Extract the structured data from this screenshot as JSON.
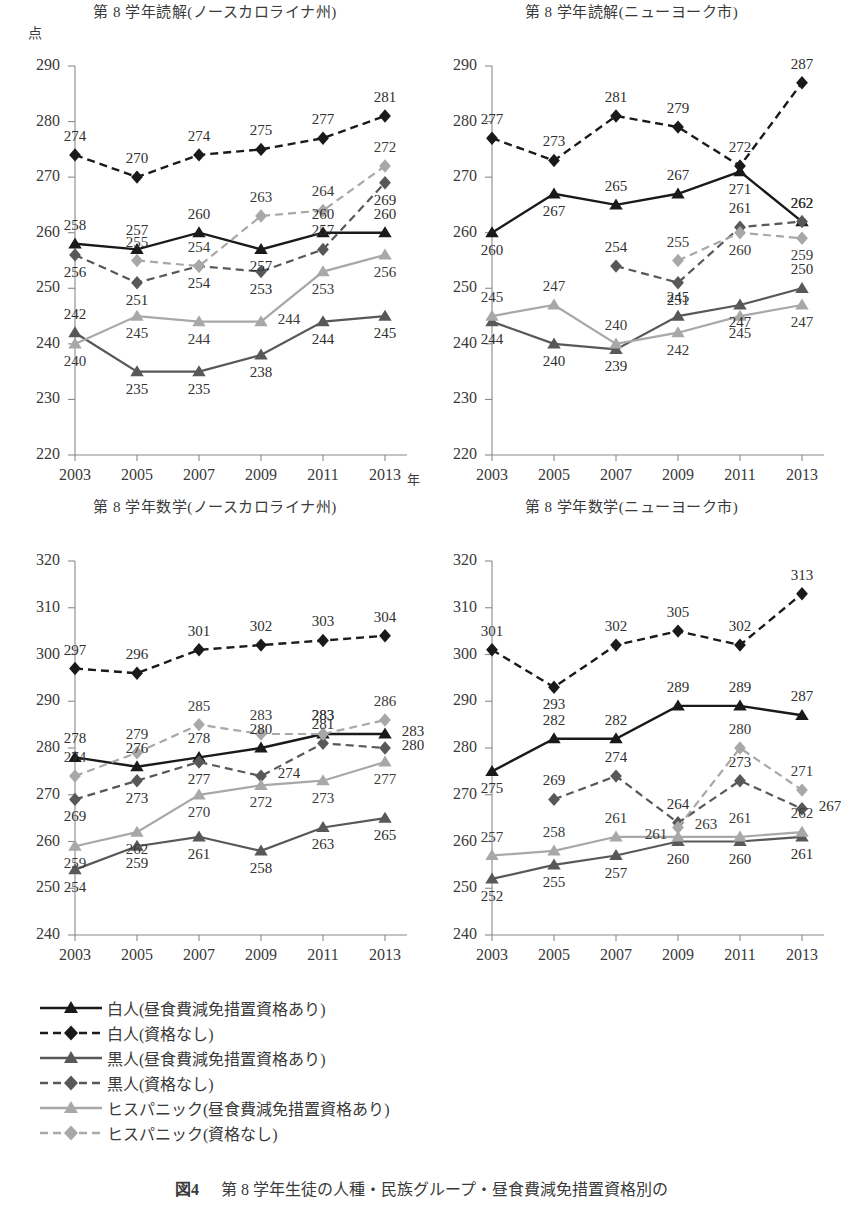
{
  "figure": {
    "caption_label": "図4",
    "caption_text": "第 8 学年生徒の人種・民族グループ・昼食費減免措置資格別の",
    "y_unit": "点",
    "x_unit": "年"
  },
  "legend": {
    "items": [
      {
        "label": "白人(昼食費減免措置資格あり)",
        "color": "#1a1a1a",
        "dash": "solid",
        "marker": "triangle"
      },
      {
        "label": "白人(資格なし)",
        "color": "#1a1a1a",
        "dash": "dashed",
        "marker": "diamond"
      },
      {
        "label": "黒人(昼食費減免措置資格あり)",
        "color": "#585858",
        "dash": "solid",
        "marker": "triangle"
      },
      {
        "label": "黒人(資格なし)",
        "color": "#585858",
        "dash": "dashed",
        "marker": "diamond"
      },
      {
        "label": "ヒスパニック(昼食費減免措置資格あり)",
        "color": "#a8a8a8",
        "dash": "solid",
        "marker": "triangle"
      },
      {
        "label": "ヒスパニック(資格なし)",
        "color": "#a8a8a8",
        "dash": "dashed",
        "marker": "diamond"
      }
    ]
  },
  "chart_data": [
    {
      "type": "line",
      "title": "第 8 学年読解(ノースカロライナ州)",
      "x": [
        "2003",
        "2005",
        "2007",
        "2009",
        "2011",
        "2013"
      ],
      "xlabel": "年",
      "ylabel": "点",
      "ylim": [
        220,
        290
      ],
      "yticks": [
        220,
        230,
        240,
        250,
        260,
        270,
        280,
        290
      ],
      "grid": false,
      "series": [
        {
          "name": "白人(昼食費減免措置資格あり)",
          "color": "#1a1a1a",
          "dash": "solid",
          "marker": "triangle",
          "values": [
            258,
            257,
            260,
            257,
            260,
            260
          ]
        },
        {
          "name": "白人(資格なし)",
          "color": "#1a1a1a",
          "dash": "dashed",
          "marker": "diamond",
          "values": [
            274,
            270,
            274,
            275,
            277,
            281
          ]
        },
        {
          "name": "黒人(昼食費減免措置資格あり)",
          "color": "#585858",
          "dash": "solid",
          "marker": "triangle",
          "values": [
            242,
            235,
            235,
            238,
            244,
            245
          ]
        },
        {
          "name": "黒人(資格なし)",
          "color": "#585858",
          "dash": "dashed",
          "marker": "diamond",
          "values": [
            256,
            251,
            254,
            253,
            257,
            269
          ]
        },
        {
          "name": "ヒスパニック(昼食費減免措置資格あり)",
          "color": "#a8a8a8",
          "dash": "solid",
          "marker": "triangle",
          "values": [
            240,
            245,
            244,
            244,
            253,
            256
          ]
        },
        {
          "name": "ヒスパニック(資格なし)",
          "color": "#a8a8a8",
          "dash": "dashed",
          "marker": "diamond",
          "values": [
            null,
            255,
            254,
            263,
            264,
            272
          ]
        }
      ]
    },
    {
      "type": "line",
      "title": "第 8 学年読解(ニューヨーク市)",
      "x": [
        "2003",
        "2005",
        "2007",
        "2009",
        "2011",
        "2013"
      ],
      "xlabel": "",
      "ylabel": "",
      "ylim": [
        220,
        290
      ],
      "yticks": [
        220,
        230,
        240,
        250,
        260,
        270,
        280,
        290
      ],
      "grid": false,
      "series": [
        {
          "name": "白人(昼食費減免措置資格あり)",
          "color": "#1a1a1a",
          "dash": "solid",
          "marker": "triangle",
          "values": [
            260,
            267,
            265,
            267,
            271,
            262
          ]
        },
        {
          "name": "白人(資格なし)",
          "color": "#1a1a1a",
          "dash": "dashed",
          "marker": "diamond",
          "values": [
            277,
            273,
            281,
            279,
            272,
            287
          ]
        },
        {
          "name": "黒人(昼食費減免措置資格あり)",
          "color": "#585858",
          "dash": "solid",
          "marker": "triangle",
          "values": [
            244,
            240,
            239,
            245,
            247,
            250
          ]
        },
        {
          "name": "黒人(資格なし)",
          "color": "#585858",
          "dash": "dashed",
          "marker": "diamond",
          "values": [
            null,
            null,
            254,
            251,
            261,
            262
          ]
        },
        {
          "name": "ヒスパニック(昼食費減免措置資格あり)",
          "color": "#a8a8a8",
          "dash": "solid",
          "marker": "triangle",
          "values": [
            245,
            247,
            240,
            242,
            245,
            247
          ]
        },
        {
          "name": "ヒスパニック(資格なし)",
          "color": "#a8a8a8",
          "dash": "dashed",
          "marker": "diamond",
          "values": [
            null,
            null,
            null,
            255,
            260,
            259
          ]
        }
      ]
    },
    {
      "type": "line",
      "title": "第 8 学年数学(ノースカロライナ州)",
      "x": [
        "2003",
        "2005",
        "2007",
        "2009",
        "2011",
        "2013"
      ],
      "xlabel": "",
      "ylabel": "",
      "ylim": [
        240,
        320
      ],
      "yticks": [
        240,
        250,
        260,
        270,
        280,
        290,
        300,
        310,
        320
      ],
      "grid": false,
      "series": [
        {
          "name": "白人(昼食費減免措置資格あり)",
          "color": "#1a1a1a",
          "dash": "solid",
          "marker": "triangle",
          "values": [
            278,
            276,
            278,
            280,
            283,
            283
          ]
        },
        {
          "name": "白人(資格なし)",
          "color": "#1a1a1a",
          "dash": "dashed",
          "marker": "diamond",
          "values": [
            297,
            296,
            301,
            302,
            303,
            304
          ]
        },
        {
          "name": "黒人(昼食費減免措置資格あり)",
          "color": "#585858",
          "dash": "solid",
          "marker": "triangle",
          "values": [
            254,
            259,
            261,
            258,
            263,
            265
          ]
        },
        {
          "name": "黒人(資格なし)",
          "color": "#585858",
          "dash": "dashed",
          "marker": "diamond",
          "values": [
            269,
            273,
            277,
            274,
            281,
            280
          ]
        },
        {
          "name": "ヒスパニック(昼食費減免措置資格あり)",
          "color": "#a8a8a8",
          "dash": "solid",
          "marker": "triangle",
          "values": [
            259,
            262,
            270,
            272,
            273,
            277
          ]
        },
        {
          "name": "ヒスパニック(資格なし)",
          "color": "#a8a8a8",
          "dash": "dashed",
          "marker": "diamond",
          "values": [
            274,
            279,
            285,
            283,
            283,
            286
          ]
        }
      ]
    },
    {
      "type": "line",
      "title": "第 8 学年数学(ニューヨーク市)",
      "x": [
        "2003",
        "2005",
        "2007",
        "2009",
        "2011",
        "2013"
      ],
      "xlabel": "",
      "ylabel": "",
      "ylim": [
        240,
        320
      ],
      "yticks": [
        240,
        250,
        260,
        270,
        280,
        290,
        300,
        310,
        320
      ],
      "grid": false,
      "series": [
        {
          "name": "白人(昼食費減免措置資格あり)",
          "color": "#1a1a1a",
          "dash": "solid",
          "marker": "triangle",
          "values": [
            275,
            282,
            282,
            289,
            289,
            287
          ]
        },
        {
          "name": "白人(資格なし)",
          "color": "#1a1a1a",
          "dash": "dashed",
          "marker": "diamond",
          "values": [
            301,
            293,
            302,
            305,
            302,
            313
          ]
        },
        {
          "name": "黒人(昼食費減免措置資格あり)",
          "color": "#585858",
          "dash": "solid",
          "marker": "triangle",
          "values": [
            252,
            255,
            257,
            260,
            260,
            261
          ]
        },
        {
          "name": "黒人(資格なし)",
          "color": "#585858",
          "dash": "dashed",
          "marker": "diamond",
          "values": [
            null,
            269,
            274,
            264,
            273,
            267
          ]
        },
        {
          "name": "ヒスパニック(昼食費減免措置資格あり)",
          "color": "#a8a8a8",
          "dash": "solid",
          "marker": "triangle",
          "values": [
            257,
            258,
            261,
            261,
            261,
            262
          ]
        },
        {
          "name": "ヒスパニック(資格なし)",
          "color": "#a8a8a8",
          "dash": "dashed",
          "marker": "diamond",
          "values": [
            null,
            null,
            null,
            263,
            280,
            271
          ]
        }
      ]
    }
  ],
  "label_offsets": [
    {
      "0": [
        "up",
        "up",
        "up",
        "down",
        "up",
        "up"
      ],
      "1": [
        "up",
        "up",
        "up",
        "up",
        "up",
        "up"
      ],
      "2": [
        "up",
        "down",
        "down",
        "down",
        "down",
        "down"
      ],
      "3": [
        "down",
        "down",
        "down",
        "down",
        "up",
        "down"
      ],
      "4": [
        "down",
        "down",
        "down",
        "right",
        "down",
        "down"
      ],
      "5": [
        "left",
        "up",
        "up",
        "up",
        "up",
        "up"
      ]
    },
    {
      "0": [
        "down",
        "down",
        "up",
        "up",
        "down",
        "up"
      ],
      "1": [
        "up",
        "up",
        "up",
        "up",
        "up",
        "up"
      ],
      "2": [
        "down",
        "down",
        "down",
        "up",
        "down",
        "up"
      ],
      "3": [
        "",
        "",
        "up",
        "down",
        "up",
        "up"
      ],
      "4": [
        "up",
        "up",
        "up",
        "down",
        "down",
        "down"
      ],
      "5": [
        "",
        "",
        "",
        "up",
        "down",
        "down"
      ]
    },
    {
      "0": [
        "up",
        "up",
        "up",
        "up",
        "up",
        "right"
      ],
      "1": [
        "up",
        "up",
        "up",
        "up",
        "up",
        "up"
      ],
      "2": [
        "down",
        "down",
        "down",
        "down",
        "down",
        "down"
      ],
      "3": [
        "down",
        "down",
        "down",
        "right",
        "up",
        "right"
      ],
      "4": [
        "down",
        "down",
        "down",
        "down",
        "down",
        "down"
      ],
      "5": [
        "up",
        "up",
        "up",
        "up",
        "up",
        "up"
      ]
    },
    {
      "0": [
        "down",
        "up",
        "up",
        "up",
        "up",
        "up"
      ],
      "1": [
        "up",
        "down",
        "up",
        "up",
        "up",
        "up"
      ],
      "2": [
        "down",
        "down",
        "down",
        "down",
        "down",
        "down"
      ],
      "3": [
        "",
        "up",
        "up",
        "up",
        "up",
        "right"
      ],
      "4": [
        "up",
        "up",
        "up",
        "left",
        "up",
        "up"
      ],
      "5": [
        "",
        "",
        "",
        "right",
        "up",
        "up"
      ]
    }
  ]
}
